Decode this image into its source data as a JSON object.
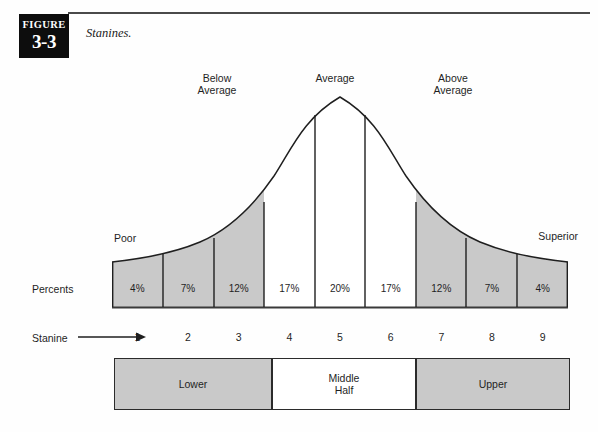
{
  "figure": {
    "badge_word": "FIGURE",
    "badge_number": "3-3",
    "caption": "Stanines."
  },
  "annotations": {
    "below_average": "Below\nAverage",
    "average": "Average",
    "above_average": "Above\nAverage",
    "poor": "Poor",
    "superior": "Superior",
    "percents_label": "Percents",
    "stanine_label": "Stanine",
    "stanine_arrow_icon": "right-arrow-icon"
  },
  "halves": [
    {
      "label": "Lower",
      "shaded": true
    },
    {
      "label": "Middle\nHalf",
      "shaded": false
    },
    {
      "label": "Upper",
      "shaded": true
    }
  ],
  "colors": {
    "shaded_band": "#c9c9c9",
    "plain_band": "#ffffff",
    "curve_stroke": "#1f1f1f",
    "badge_background": "#0d0d0d",
    "rule": "#4a4a4a"
  },
  "chart_data": {
    "type": "bar",
    "title": "Stanines.",
    "xlabel": "Stanine",
    "ylabel": "Percents",
    "categories": [
      "1",
      "2",
      "3",
      "4",
      "5",
      "6",
      "7",
      "8",
      "9"
    ],
    "values": [
      4,
      7,
      12,
      17,
      20,
      17,
      12,
      7,
      4
    ],
    "value_labels": [
      "4%",
      "7%",
      "12%",
      "17%",
      "20%",
      "17%",
      "12%",
      "7%",
      "4%"
    ],
    "ylim": [
      0,
      21
    ],
    "grid": false,
    "legend": "none",
    "overlay_curve": "normal-distribution-bell-curve",
    "band_shading": [
      true,
      true,
      true,
      false,
      false,
      false,
      true,
      true,
      true
    ],
    "annotations": [
      {
        "text": "Poor",
        "stanine": 1
      },
      {
        "text": "Below Average",
        "stanines": [
          2,
          3,
          4
        ]
      },
      {
        "text": "Average",
        "stanines": [
          4,
          5,
          6
        ]
      },
      {
        "text": "Above Average",
        "stanines": [
          6,
          7,
          8
        ]
      },
      {
        "text": "Superior",
        "stanine": 9
      },
      {
        "text": "Lower",
        "stanines": [
          1,
          2,
          3
        ]
      },
      {
        "text": "Middle Half",
        "stanines": [
          4,
          5,
          6
        ]
      },
      {
        "text": "Upper",
        "stanines": [
          7,
          8,
          9
        ]
      }
    ]
  }
}
